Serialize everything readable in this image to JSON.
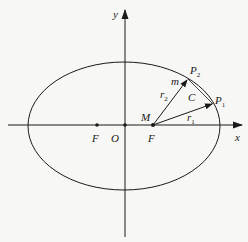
{
  "diagram": {
    "type": "ellipse-orbit-sector",
    "colors": {
      "stroke": "#1a1a1a",
      "background": "#f7f7f5"
    },
    "axes": {
      "x_label": "x",
      "y_label": "y",
      "origin_label": "O"
    },
    "ellipse": {
      "cx": 124,
      "cy": 126,
      "rx": 96,
      "ry": 64
    },
    "points": {
      "focus_left": {
        "label": "F",
        "x": 97,
        "y": 125
      },
      "origin": {
        "label": "O",
        "x": 125,
        "y": 125
      },
      "focus_right": {
        "label": "F",
        "x": 153,
        "y": 125
      },
      "M": {
        "label": "M"
      },
      "P1": {
        "label": "P",
        "sub": "1",
        "x": 213,
        "y": 104
      },
      "P2": {
        "label": "P",
        "sub": "2",
        "x": 188,
        "y": 79
      }
    },
    "vectors": {
      "r1": {
        "label": "r",
        "sub": "1"
      },
      "r2": {
        "label": "r",
        "sub": "2"
      }
    },
    "mass_label": "m",
    "arc_label": "C"
  }
}
